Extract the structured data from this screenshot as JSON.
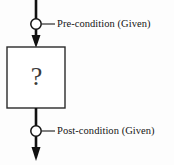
{
  "diagram": {
    "type": "flowchart",
    "title": "",
    "background_color": "#fdfdfd",
    "line_color": "#111111",
    "box_stroke_color": "#2a2a2a",
    "box_fill_color": "#ffffff",
    "marker_fill_color": "#ffffff",
    "process": {
      "glyph": "?",
      "shape": "rectangle",
      "x": 7,
      "y": 47,
      "width": 58,
      "height": 61
    },
    "annotations": [
      {
        "id": "precondition",
        "label": "Pre-condition (Given)",
        "marker": "circle",
        "marker_x": 36,
        "marker_y": 24
      },
      {
        "id": "postcondition",
        "label": "Post-condition (Given)",
        "marker": "circle",
        "marker_x": 36,
        "marker_y": 131
      }
    ],
    "flow": {
      "direction": "top-to-bottom",
      "entry_arrow": "down",
      "exit_arrow": "down"
    }
  }
}
